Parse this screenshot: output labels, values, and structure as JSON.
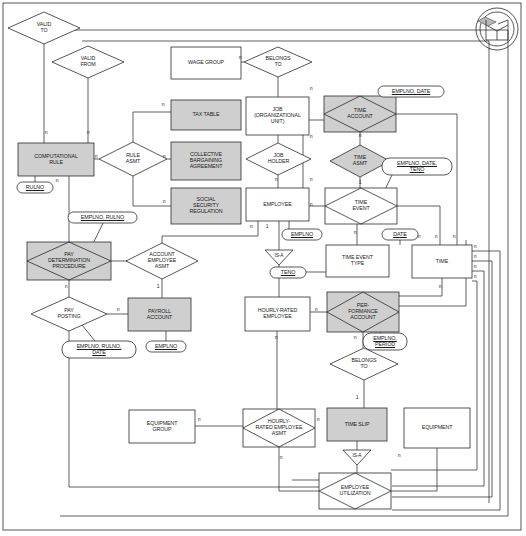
{
  "diagram": {
    "logo_name": "open-box-logo",
    "colors": {
      "shaded_fill": "#cfcfcf",
      "white_fill": "#ffffff",
      "stroke": "#2b2b2b",
      "text": "#1a1a1a",
      "background": "#ffffff"
    },
    "entities": [
      {
        "id": "wage_group",
        "label": "WAGE GROUP",
        "shape": "rectangle",
        "fill": "white",
        "x": 171,
        "y": 47,
        "w": 70,
        "h": 32
      },
      {
        "id": "tax_table",
        "label": "TAX TABLE",
        "shape": "rectangle",
        "fill": "shaded",
        "x": 171,
        "y": 100,
        "w": 70,
        "h": 30
      },
      {
        "id": "cba",
        "label": "COLLECTIVE\nBARGAINING\nAGREEMENT",
        "shape": "rectangle",
        "fill": "shaded",
        "x": 171,
        "y": 142,
        "w": 70,
        "h": 38
      },
      {
        "id": "ssr",
        "label": "SOCIAL\nSECURITY\nREGULATION",
        "shape": "rectangle",
        "fill": "shaded",
        "x": 171,
        "y": 188,
        "w": 70,
        "h": 36
      },
      {
        "id": "comp_rule",
        "label": "COMPUTATIONAL\nRULE",
        "shape": "rectangle",
        "fill": "shaded",
        "x": 18,
        "y": 143,
        "w": 76,
        "h": 33
      },
      {
        "id": "job_org_unit",
        "label": "JOB\n(ORGANIZATIONAL\nUNIT)",
        "shape": "rectangle",
        "fill": "white",
        "x": 246,
        "y": 97,
        "w": 63,
        "h": 38
      },
      {
        "id": "employee",
        "label": "EMPLOYEE",
        "shape": "rectangle",
        "fill": "white",
        "x": 246,
        "y": 188,
        "w": 63,
        "h": 33
      },
      {
        "id": "payroll_account",
        "label": "PAYROLL\nACCOUNT",
        "shape": "rectangle",
        "fill": "shaded",
        "x": 128,
        "y": 298,
        "w": 63,
        "h": 33
      },
      {
        "id": "hourly_rated_emp",
        "label": "HOURLY-RATED\nEMPLOYEE",
        "shape": "rectangle",
        "fill": "white",
        "x": 245,
        "y": 297,
        "w": 65,
        "h": 34
      },
      {
        "id": "time_event_type",
        "label": "TIME EVENT\nTYPE",
        "shape": "rectangle",
        "fill": "white",
        "x": 326,
        "y": 245,
        "w": 63,
        "h": 32
      },
      {
        "id": "time",
        "label": "TIME",
        "shape": "rectangle",
        "fill": "white",
        "x": 412,
        "y": 245,
        "w": 60,
        "h": 33
      },
      {
        "id": "equipment_group",
        "label": "EQUIPMENT\nGROUP",
        "shape": "rectangle",
        "fill": "white",
        "x": 129,
        "y": 410,
        "w": 66,
        "h": 33
      },
      {
        "id": "equipment",
        "label": "EQUIPMENT",
        "shape": "rectangle",
        "fill": "white",
        "x": 404,
        "y": 408,
        "w": 66,
        "h": 40
      },
      {
        "id": "time_slip",
        "label": "TIME SLIP",
        "shape": "rectangle",
        "fill": "shaded",
        "x": 327,
        "y": 408,
        "w": 60,
        "h": 33
      }
    ],
    "relationships": [
      {
        "id": "valid_to",
        "label": "VALID\nTO",
        "shape": "diamond",
        "fill": "white",
        "x": 8,
        "y": 12,
        "w": 72,
        "h": 32,
        "boxed": false
      },
      {
        "id": "valid_from",
        "label": "VALID\nFROM",
        "shape": "diamond",
        "fill": "white",
        "x": 52,
        "y": 46,
        "w": 72,
        "h": 32,
        "boxed": false
      },
      {
        "id": "rule_asmt",
        "label": "RULE\nASMT",
        "shape": "diamond",
        "fill": "white",
        "x": 99,
        "y": 142,
        "w": 68,
        "h": 34,
        "boxed": false
      },
      {
        "id": "belongs_to_1",
        "label": "BELONGS\nTO",
        "shape": "diamond",
        "fill": "white",
        "x": 244,
        "y": 47,
        "w": 68,
        "h": 30,
        "boxed": false
      },
      {
        "id": "job_holder",
        "label": "JOB\nHOLDER",
        "shape": "diamond",
        "fill": "white",
        "x": 246,
        "y": 143,
        "w": 65,
        "h": 32,
        "boxed": false
      },
      {
        "id": "time_account",
        "label": "TIME\nACCOUNT",
        "shape": "diamond",
        "fill": "shaded",
        "x": 324,
        "y": 96,
        "w": 72,
        "h": 36,
        "boxed": true
      },
      {
        "id": "time_asmt",
        "label": "TIME\nASMT",
        "shape": "diamond",
        "fill": "shaded",
        "x": 330,
        "y": 145,
        "w": 60,
        "h": 32,
        "boxed": false
      },
      {
        "id": "time_event",
        "label": "TIME\nEVENT",
        "shape": "diamond",
        "fill": "white",
        "x": 325,
        "y": 188,
        "w": 72,
        "h": 36,
        "boxed": true
      },
      {
        "id": "pay_determination",
        "label": "PAY\nDETERMINATION\nPROCEDURE",
        "shape": "diamond",
        "fill": "shaded",
        "x": 27,
        "y": 242,
        "w": 84,
        "h": 38,
        "boxed": true
      },
      {
        "id": "account_emp_asmt",
        "label": "ACCOUNT\nEMPLOYEE\nASMT",
        "shape": "diamond",
        "fill": "white",
        "x": 126,
        "y": 243,
        "w": 72,
        "h": 36,
        "boxed": false
      },
      {
        "id": "pay_posting",
        "label": "PAY\nPOSTING",
        "shape": "diamond",
        "fill": "white",
        "x": 31,
        "y": 297,
        "w": 76,
        "h": 34,
        "boxed": false
      },
      {
        "id": "performance_acct",
        "label": "PER-\nFORMANCE\nACCOUNT",
        "shape": "diamond",
        "fill": "shaded",
        "x": 327,
        "y": 292,
        "w": 72,
        "h": 40,
        "boxed": true
      },
      {
        "id": "belongs_to_2",
        "label": "BELONGS\nTO",
        "shape": "diamond",
        "fill": "white",
        "x": 330,
        "y": 348,
        "w": 68,
        "h": 32,
        "boxed": false
      },
      {
        "id": "hourly_rated_asmt",
        "label": "HOURLY-\nRATED EMPLOYEE\nASMT",
        "shape": "diamond",
        "fill": "white",
        "x": 243,
        "y": 409,
        "w": 72,
        "h": 38,
        "boxed": true
      },
      {
        "id": "employee_util",
        "label": "EMPLOYEE\nUTILIZATION",
        "shape": "diamond",
        "fill": "white",
        "x": 319,
        "y": 473,
        "w": 72,
        "h": 36,
        "boxed": true
      }
    ],
    "isa_nodes": [
      {
        "id": "isa_employee",
        "label": "IS-A",
        "x": 265,
        "y": 250,
        "w": 28,
        "h": 15
      },
      {
        "id": "isa_time_slip",
        "label": "IS-A",
        "x": 343,
        "y": 450,
        "w": 28,
        "h": 15
      }
    ],
    "attributes": [
      {
        "id": "attr_rulno",
        "label": "RULNO",
        "x": 17,
        "y": 182,
        "w": 36,
        "h": 11
      },
      {
        "id": "attr_emplno_rulno",
        "label": "EMPLNO, RULNO",
        "x": 68,
        "y": 212,
        "w": 69,
        "h": 11
      },
      {
        "id": "attr_emplno_rulno_date",
        "label": "EMPLNO, RULNO,\nDATE",
        "x": 62,
        "y": 341,
        "w": 74,
        "h": 17
      },
      {
        "id": "attr_emplno_payroll",
        "label": "EMPLNO",
        "x": 146,
        "y": 341,
        "w": 40,
        "h": 11
      },
      {
        "id": "attr_emplno_employee",
        "label": "EMPLNO",
        "x": 282,
        "y": 229,
        "w": 40,
        "h": 11
      },
      {
        "id": "attr_emplno_date",
        "label": "EMPLNO, DATE",
        "x": 378,
        "y": 86,
        "w": 66,
        "h": 11
      },
      {
        "id": "attr_emplno_date_teno",
        "label": "EMPLNO, DATE,\nTENO",
        "x": 382,
        "y": 158,
        "w": 70,
        "h": 17
      },
      {
        "id": "attr_teno",
        "label": "TENO",
        "x": 270,
        "y": 267,
        "w": 36,
        "h": 11
      },
      {
        "id": "attr_date",
        "label": "DATE",
        "x": 382,
        "y": 229,
        "w": 36,
        "h": 11
      },
      {
        "id": "attr_emplno_period",
        "label": "EMPLNO,\nPERIOD",
        "x": 363,
        "y": 333,
        "w": 44,
        "h": 17
      }
    ],
    "cardinalities": [
      {
        "label": "n",
        "x": 46,
        "y": 133
      },
      {
        "label": "n",
        "x": 88,
        "y": 133
      },
      {
        "label": "n",
        "x": 96,
        "y": 157
      },
      {
        "label": "n",
        "x": 163,
        "y": 105
      },
      {
        "label": "n",
        "x": 164,
        "y": 157
      },
      {
        "label": "n",
        "x": 164,
        "y": 202
      },
      {
        "label": "n",
        "x": 57,
        "y": 181
      },
      {
        "label": "n",
        "x": 240,
        "y": 58
      },
      {
        "label": "n",
        "x": 311,
        "y": 89
      },
      {
        "label": "n",
        "x": 311,
        "y": 137
      },
      {
        "label": "n",
        "x": 311,
        "y": 180
      },
      {
        "label": "n",
        "x": 276,
        "y": 180
      },
      {
        "label": "n",
        "x": 251,
        "y": 227
      },
      {
        "label": "1",
        "x": 267,
        "y": 227
      },
      {
        "label": "n",
        "x": 311,
        "y": 205
      },
      {
        "label": "n",
        "x": 360,
        "y": 136
      },
      {
        "label": "1",
        "x": 360,
        "y": 183
      },
      {
        "label": "n",
        "x": 355,
        "y": 233
      },
      {
        "label": "n",
        "x": 419,
        "y": 237
      },
      {
        "label": "n",
        "x": 436,
        "y": 237
      },
      {
        "label": "n",
        "x": 454,
        "y": 237
      },
      {
        "label": "n",
        "x": 475,
        "y": 247
      },
      {
        "label": "n",
        "x": 475,
        "y": 257
      },
      {
        "label": "n",
        "x": 475,
        "y": 267
      },
      {
        "label": "n",
        "x": 475,
        "y": 277
      },
      {
        "label": "n",
        "x": 440,
        "y": 287
      },
      {
        "label": "n",
        "x": 66,
        "y": 287
      },
      {
        "label": "1",
        "x": 158,
        "y": 287
      },
      {
        "label": "n",
        "x": 118,
        "y": 310
      },
      {
        "label": "n",
        "x": 316,
        "y": 310
      },
      {
        "label": "n",
        "x": 355,
        "y": 338
      },
      {
        "label": "1",
        "x": 357,
        "y": 398
      },
      {
        "label": "n",
        "x": 276,
        "y": 338
      },
      {
        "label": "n",
        "x": 199,
        "y": 420
      },
      {
        "label": "n",
        "x": 318,
        "y": 420
      },
      {
        "label": "n",
        "x": 281,
        "y": 458
      },
      {
        "label": "n",
        "x": 399,
        "y": 456
      }
    ]
  }
}
